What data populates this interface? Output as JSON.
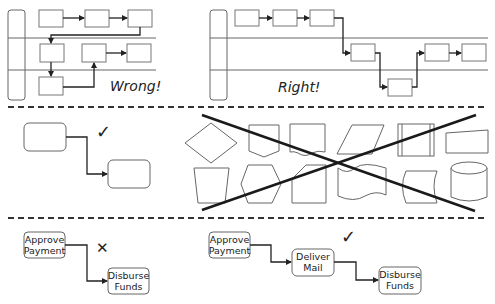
{
  "sections": {
    "swimlanes": {
      "wrong_label": "Wrong!",
      "right_label": "Right!"
    },
    "shapes": {
      "good_mark": "✓",
      "crossed_out_shapes": [
        "decision-diamond",
        "off-page-connector",
        "document",
        "data-parallelogram",
        "predefined-process",
        "manual-input",
        "manual-operation",
        "preparation-hexagon",
        "card",
        "punched-tape",
        "stored-data",
        "database-cylinder"
      ]
    },
    "naming": {
      "bad_mark": "✕",
      "good_mark": "✓",
      "bad_example": {
        "box1": [
          "Approve",
          "Payment"
        ],
        "box2": [
          "Disburse",
          "Funds"
        ]
      },
      "good_example": {
        "box1": [
          "Approve",
          "Payment"
        ],
        "box2": [
          "Deliver",
          "Mail"
        ],
        "box3": [
          "Disburse",
          "Funds"
        ]
      }
    }
  },
  "colors": {
    "stroke": "#666666",
    "flow": "#222222",
    "background": "#ffffff"
  }
}
